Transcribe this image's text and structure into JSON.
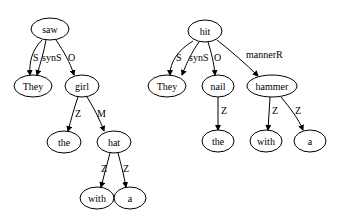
{
  "trees": [
    {
      "name": "tree-saw",
      "nodes": [
        {
          "id": "saw",
          "label": "saw",
          "x": 50,
          "y": 29,
          "rx": 19
        },
        {
          "id": "They",
          "label": "They",
          "x": 33,
          "y": 86,
          "rx": 19
        },
        {
          "id": "girl",
          "label": "girl",
          "x": 82,
          "y": 86,
          "rx": 17
        },
        {
          "id": "the",
          "label": "the",
          "x": 64,
          "y": 142,
          "rx": 17
        },
        {
          "id": "hat",
          "label": "hat",
          "x": 114,
          "y": 142,
          "rx": 17
        },
        {
          "id": "with",
          "label": "with",
          "x": 97,
          "y": 198,
          "rx": 17
        },
        {
          "id": "a",
          "label": "a",
          "x": 130,
          "y": 198,
          "rx": 16
        }
      ],
      "edges": [
        {
          "from": "saw",
          "to": "They",
          "label": "S",
          "d": "M42,40 C32,50 29,62 30,75",
          "lx": 33,
          "ly": 61
        },
        {
          "from": "saw",
          "to": "They",
          "label": "synS",
          "d": "M46,40 C44,52 40,64 37,75",
          "lx": 42,
          "ly": 61
        },
        {
          "from": "saw",
          "to": "girl",
          "label": "O",
          "d": "M56,40 C64,52 70,62 74,75",
          "lx": 68,
          "ly": 61
        },
        {
          "from": "girl",
          "to": "the",
          "label": "Z",
          "d": "M78,97 C74,108 71,120 68,131",
          "lx": 75,
          "ly": 117
        },
        {
          "from": "girl",
          "to": "hat",
          "label": "M",
          "d": "M87,97 C94,108 100,120 104,131",
          "lx": 97,
          "ly": 117
        },
        {
          "from": "hat",
          "to": "with",
          "label": "Z",
          "d": "M110,153 C107,164 104,176 101,187",
          "lx": 101,
          "ly": 172
        },
        {
          "from": "hat",
          "to": "a",
          "label": "Z",
          "d": "M118,153 C121,164 124,176 126,187",
          "lx": 123,
          "ly": 172
        }
      ]
    },
    {
      "name": "tree-hit",
      "nodes": [
        {
          "id": "hit",
          "label": "hit",
          "x": 205,
          "y": 31,
          "rx": 17
        },
        {
          "id": "They2",
          "label": "They",
          "x": 167,
          "y": 86,
          "rx": 19
        },
        {
          "id": "nail",
          "label": "nail",
          "x": 218,
          "y": 86,
          "rx": 16
        },
        {
          "id": "hammer",
          "label": "hammer",
          "x": 272,
          "y": 86,
          "rx": 25
        },
        {
          "id": "the2",
          "label": "the",
          "x": 218,
          "y": 141,
          "rx": 16
        },
        {
          "id": "with2",
          "label": "with",
          "x": 266,
          "y": 141,
          "rx": 16
        },
        {
          "id": "a2",
          "label": "a",
          "x": 310,
          "y": 141,
          "rx": 16
        }
      ],
      "edges": [
        {
          "from": "hit",
          "to": "They",
          "label": "S",
          "d": "M193,41 C178,50 170,62 170,75",
          "lx": 176,
          "ly": 61
        },
        {
          "from": "hit",
          "to": "They",
          "label": "synS",
          "d": "M199,42 C192,52 187,62 182,75",
          "lx": 189,
          "ly": 61
        },
        {
          "from": "hit",
          "to": "nail",
          "label": "O",
          "d": "M208,42 C211,52 214,62 215,75",
          "lx": 214,
          "ly": 61
        },
        {
          "from": "hit",
          "to": "hammer",
          "label": "mannerR",
          "d": "M217,40 C232,52 246,64 258,76",
          "lx": 246,
          "ly": 58
        },
        {
          "from": "nail",
          "to": "the",
          "label": "Z",
          "d": "M218,97 L218,130",
          "lx": 221,
          "ly": 114
        },
        {
          "from": "hammer",
          "to": "with",
          "label": "Z",
          "d": "M270,97 L268,130",
          "lx": 272,
          "ly": 114
        },
        {
          "from": "hammer",
          "to": "a",
          "label": "Z",
          "d": "M281,97 C290,108 298,118 303,130",
          "lx": 295,
          "ly": 114
        }
      ]
    }
  ]
}
